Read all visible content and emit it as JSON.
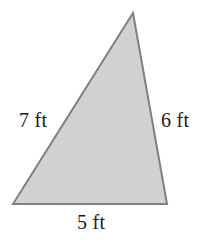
{
  "figure": {
    "name": "triangle",
    "shape_type": "triangle",
    "fill_color": "#d3d3d3",
    "stroke_color": "#808080",
    "stroke_width": 2,
    "background_color": "#ffffff",
    "unit": "ft",
    "vertices": {
      "apex": [
        133,
        13
      ],
      "bottom_left": [
        13,
        204
      ],
      "bottom_right": [
        167,
        204
      ]
    },
    "labels": {
      "left_side": "7 ft",
      "right_side": "6 ft",
      "base": "5 ft"
    },
    "side_lengths": {
      "left_side": 7,
      "right_side": 6,
      "base": 5
    }
  }
}
